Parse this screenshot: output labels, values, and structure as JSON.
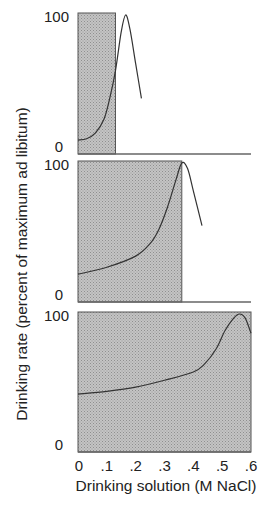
{
  "chart_data": {
    "type": "line",
    "layout": "three vertically stacked panels sharing x axis",
    "xlabel": "Drinking solution (M NaCl)",
    "ylabel": "Drinking rate (percent of maximum ad libitum)",
    "x_ticks": [
      "0",
      ".1",
      ".2",
      ".3",
      ".4",
      ".5",
      ".6"
    ],
    "xlim": [
      0,
      0.6
    ],
    "ylim": [
      0,
      100
    ],
    "grid": false,
    "legend": null,
    "shading_color": "#b5b5b5",
    "line_color": "#333333",
    "panels": [
      {
        "name": "top",
        "y_ticks": [
          "100",
          "0"
        ],
        "shaded_region_x": [
          0,
          0.13
        ],
        "series": {
          "x": [
            0.0,
            0.03,
            0.06,
            0.09,
            0.11,
            0.13,
            0.15,
            0.165,
            0.18,
            0.2,
            0.22
          ],
          "y": [
            10,
            11,
            15,
            25,
            40,
            60,
            88,
            100,
            90,
            65,
            40
          ]
        }
      },
      {
        "name": "middle",
        "y_ticks": [
          "100",
          "0"
        ],
        "shaded_region_x": [
          0,
          0.36
        ],
        "series": {
          "x": [
            0.0,
            0.1,
            0.2,
            0.25,
            0.28,
            0.31,
            0.34,
            0.36,
            0.38,
            0.4,
            0.43
          ],
          "y": [
            20,
            25,
            33,
            42,
            52,
            68,
            88,
            100,
            96,
            80,
            55
          ]
        }
      },
      {
        "name": "bottom",
        "y_ticks": [
          "100",
          "0"
        ],
        "shaded_region_x": [
          0,
          0.6
        ],
        "series": {
          "x": [
            0.0,
            0.1,
            0.2,
            0.3,
            0.4,
            0.44,
            0.48,
            0.51,
            0.54,
            0.56,
            0.58,
            0.6
          ],
          "y": [
            42,
            44,
            47,
            52,
            58,
            64,
            75,
            88,
            97,
            100,
            97,
            86
          ]
        }
      }
    ]
  }
}
